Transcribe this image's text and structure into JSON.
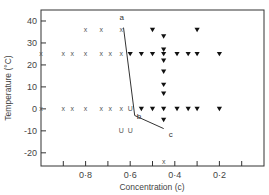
{
  "chart_data": {
    "type": "scatter",
    "title": "",
    "xlabel": "Concentration (c)",
    "ylabel": "Temperature (°C)",
    "xlim": [
      1.0,
      0.0
    ],
    "ylim": [
      -26,
      45
    ],
    "x_reversed": true,
    "grid": false,
    "x_ticks": [
      0.9,
      0.8,
      0.7,
      0.6,
      0.5,
      0.4,
      0.3,
      0.2,
      0.1
    ],
    "x_tick_labels": [
      {
        "value": 0.8,
        "label": "0·8"
      },
      {
        "value": 0.6,
        "label": "0·6"
      },
      {
        "value": 0.4,
        "label": "0·4"
      },
      {
        "value": 0.2,
        "label": "0·2"
      }
    ],
    "y_ticks": [
      {
        "value": 40,
        "label": "40"
      },
      {
        "value": 30,
        "label": "30"
      },
      {
        "value": 20,
        "label": "20"
      },
      {
        "value": 10,
        "label": "10"
      },
      {
        "value": 0,
        "label": "0"
      },
      {
        "value": -10,
        "label": "-10"
      },
      {
        "value": -20,
        "label": "-20"
      }
    ],
    "series": [
      {
        "name": "x",
        "marker": "cross",
        "glyph": "x",
        "points": [
          [
            1.0,
            25
          ],
          [
            0.9,
            25
          ],
          [
            0.86,
            25
          ],
          [
            0.8,
            25
          ],
          [
            0.73,
            25
          ],
          [
            0.69,
            25
          ],
          [
            0.64,
            25
          ],
          [
            0.8,
            36
          ],
          [
            0.73,
            36
          ],
          [
            0.64,
            36
          ],
          [
            1.0,
            0
          ],
          [
            0.9,
            0
          ],
          [
            0.86,
            0
          ],
          [
            0.8,
            0
          ],
          [
            0.73,
            0
          ],
          [
            0.69,
            0
          ],
          [
            0.64,
            0
          ],
          [
            0.45,
            -24
          ]
        ]
      },
      {
        "name": "U",
        "marker": "u",
        "glyph": "U",
        "points": [
          [
            0.6,
            0
          ],
          [
            0.64,
            -10
          ],
          [
            0.6,
            -10
          ]
        ]
      },
      {
        "name": "triangle",
        "marker": "filled-triangle-down",
        "points": [
          [
            0.5,
            36
          ],
          [
            0.45,
            33
          ],
          [
            0.3,
            36
          ],
          [
            0.6,
            25
          ],
          [
            0.55,
            25
          ],
          [
            0.5,
            25
          ],
          [
            0.45,
            25
          ],
          [
            0.39,
            25
          ],
          [
            0.34,
            25
          ],
          [
            0.3,
            25
          ],
          [
            0.2,
            25
          ],
          [
            0.45,
            27
          ],
          [
            0.45,
            22
          ],
          [
            0.45,
            17
          ],
          [
            0.45,
            11
          ],
          [
            0.45,
            7
          ],
          [
            0.55,
            0
          ],
          [
            0.5,
            0
          ],
          [
            0.45,
            0
          ],
          [
            0.39,
            0
          ],
          [
            0.34,
            0
          ],
          [
            0.3,
            0
          ],
          [
            0.2,
            0
          ],
          [
            0.45,
            -5
          ]
        ]
      }
    ],
    "boundary_line": {
      "name": "a-b-c",
      "points": [
        {
          "label": "a",
          "c": 0.63,
          "t": 37
        },
        {
          "label": "b",
          "c": 0.58,
          "t": -3
        },
        {
          "label": "c",
          "c": 0.45,
          "t": -9
        }
      ]
    }
  }
}
